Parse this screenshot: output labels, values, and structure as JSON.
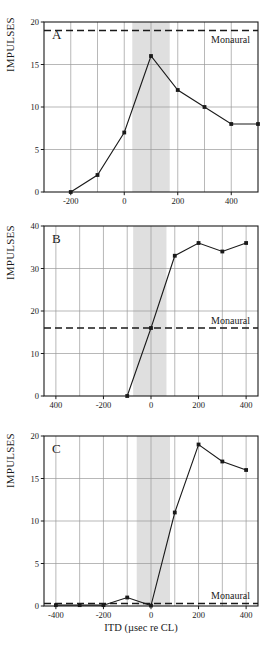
{
  "figure": {
    "ylabel": "IMPULSES",
    "xlabel": "ITD (µsec re CL)",
    "monaural_label": "Monaural",
    "line_color": "#1a1a1a",
    "grid_color": "#9a9a9a",
    "band_color": "#d9d9d9",
    "axis_color": "#1a1a1a"
  },
  "chart_data": [
    {
      "type": "line",
      "panel": "A",
      "title": "A",
      "xlabel": "",
      "ylabel": "IMPULSES",
      "xlim": [
        -300,
        500
      ],
      "ylim": [
        0,
        20
      ],
      "xticks": [
        -200,
        0,
        200,
        400
      ],
      "xticklabels": [
        "-200",
        "0",
        "200",
        "400"
      ],
      "yticks": [
        0,
        5,
        10,
        15,
        20
      ],
      "yticklabels": [
        "0",
        "5",
        "10",
        "15",
        "20"
      ],
      "gridlines_x": [
        -300,
        -200,
        -100,
        0,
        100,
        200,
        300,
        400,
        500
      ],
      "gridlines_y": [
        0,
        5,
        10,
        15,
        20
      ],
      "grid": true,
      "legend": "none",
      "x": [
        -200,
        -100,
        0,
        100,
        200,
        300,
        400,
        500
      ],
      "values": [
        0,
        2,
        7,
        16,
        12,
        10,
        8,
        8
      ],
      "monaural_level": 19,
      "monaural_label": "Monaural",
      "shaded_band": [
        30,
        170
      ]
    },
    {
      "type": "line",
      "panel": "B",
      "title": "B",
      "xlabel": "",
      "ylabel": "IMPULSES",
      "xlim": [
        -450,
        450
      ],
      "ylim": [
        0,
        40
      ],
      "xticks": [
        -400,
        -200,
        0,
        200,
        400
      ],
      "xticklabels": [
        "400",
        "-200",
        "0",
        "200",
        "400"
      ],
      "yticks": [
        0,
        10,
        20,
        30,
        40
      ],
      "yticklabels": [
        "0",
        "10",
        "20",
        "30",
        "40"
      ],
      "gridlines_x": [
        -400,
        -300,
        -200,
        -100,
        0,
        100,
        200,
        300,
        400
      ],
      "gridlines_y": [
        0,
        10,
        20,
        30,
        40
      ],
      "grid": true,
      "legend": "none",
      "x": [
        -100,
        0,
        100,
        200,
        300,
        400
      ],
      "values": [
        0,
        16,
        33,
        36,
        34,
        36
      ],
      "monaural_level": 16,
      "monaural_label": "Monaural",
      "shaded_band": [
        -75,
        65
      ]
    },
    {
      "type": "line",
      "panel": "C",
      "title": "C",
      "xlabel": "ITD (µsec re CL)",
      "ylabel": "IMPULSES",
      "xlim": [
        -450,
        450
      ],
      "ylim": [
        0,
        20
      ],
      "xticks": [
        -400,
        -200,
        0,
        200,
        400
      ],
      "xticklabels": [
        "-400",
        "-200",
        "0",
        "200",
        "400"
      ],
      "yticks": [
        0,
        5,
        10,
        15,
        20
      ],
      "yticklabels": [
        "0",
        "5",
        "10",
        "15",
        "20"
      ],
      "gridlines_x": [
        -400,
        -300,
        -200,
        -100,
        0,
        100,
        200,
        300,
        400
      ],
      "gridlines_y": [
        0,
        5,
        10,
        15,
        20
      ],
      "grid": true,
      "legend": "none",
      "x": [
        -400,
        -300,
        -200,
        -100,
        0,
        100,
        200,
        300,
        400
      ],
      "values": [
        0.1,
        0.1,
        0.1,
        1.0,
        0.05,
        11,
        19,
        17,
        16
      ],
      "monaural_level": 0.3,
      "monaural_label": "Monaural",
      "shaded_band": [
        -60,
        80
      ]
    }
  ]
}
